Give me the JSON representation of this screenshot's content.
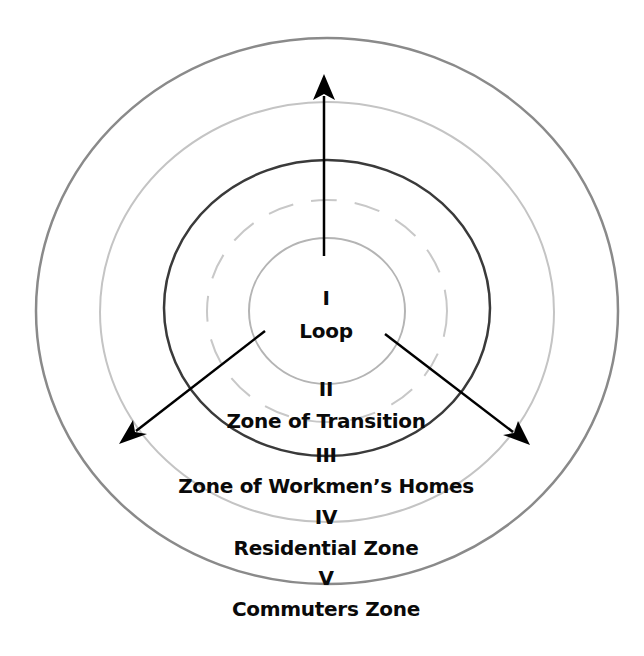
{
  "center": {
    "x": 327,
    "y": 311
  },
  "rings": [
    {
      "id": "outer",
      "rx": 291,
      "ry": 273,
      "stroke": "#8a8a8a",
      "width": 2.5,
      "dashed": false
    },
    {
      "id": "second",
      "rx": 227,
      "ry": 210,
      "stroke": "#c4c4c4",
      "width": 2,
      "dashed": false
    },
    {
      "id": "third",
      "rx": 163,
      "ry": 148,
      "stroke": "#3a3a3a",
      "width": 2.5,
      "dashed": false
    },
    {
      "id": "dashed",
      "rx": 120,
      "ry": 111,
      "stroke": "#c8c8c8",
      "width": 2,
      "dashed": true
    },
    {
      "id": "inner",
      "rx": 78,
      "ry": 73,
      "stroke": "#b4b4b4",
      "width": 2,
      "dashed": false
    }
  ],
  "arrows": [
    {
      "direction": "up",
      "x1": 324,
      "y1": 256,
      "x2": 324,
      "y2": 74
    },
    {
      "direction": "down-left",
      "x1": 265,
      "y1": 331,
      "x2": 119,
      "y2": 444
    },
    {
      "direction": "down-right",
      "x1": 385,
      "y1": 334,
      "x2": 530,
      "y2": 445
    }
  ],
  "zones": [
    {
      "numeral": "I",
      "name": "Loop"
    },
    {
      "numeral": "II",
      "name": "Zone of Transition"
    },
    {
      "numeral": "III",
      "name": "Zone of Workmen’s Homes"
    },
    {
      "numeral": "IV",
      "name": "Residential Zone"
    },
    {
      "numeral": "V",
      "name": "Commuters Zone"
    }
  ]
}
